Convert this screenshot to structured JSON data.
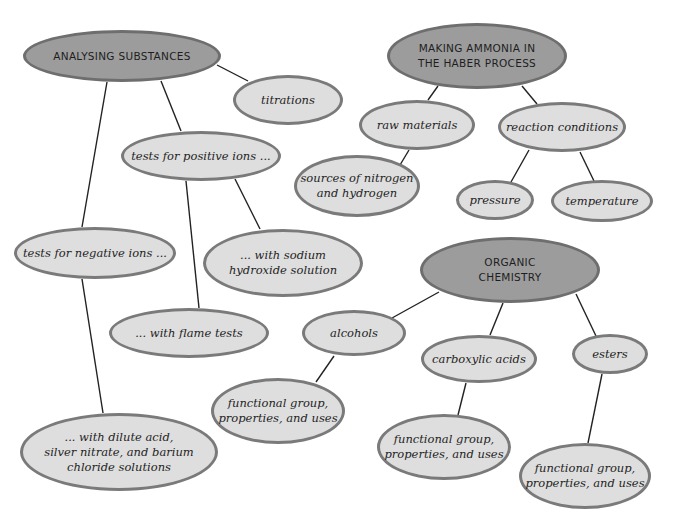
{
  "diagram": {
    "type": "concept-map",
    "colors": {
      "main_fill": "#9c9c9c",
      "main_border": "#6e6e6e",
      "sub_fill": "#dedede",
      "sub_border": "#7a7a7a",
      "line": "#222222"
    },
    "nodes": [
      {
        "id": "analysing",
        "label": "ANALYSING SUBSTANCES",
        "kind": "main",
        "cx": 122,
        "cy": 56,
        "rx": 99,
        "ry": 26
      },
      {
        "id": "titrations",
        "label": "titrations",
        "kind": "sub",
        "cx": 288,
        "cy": 100,
        "rx": 55,
        "ry": 25
      },
      {
        "id": "positive",
        "label": "tests for positive ions ...",
        "kind": "sub",
        "cx": 201,
        "cy": 156,
        "rx": 80,
        "ry": 25
      },
      {
        "id": "negative",
        "label": "tests for negative ions ...",
        "kind": "sub",
        "cx": 95,
        "cy": 253,
        "rx": 81,
        "ry": 26
      },
      {
        "id": "sodium",
        "label": "... with sodium\nhydroxide solution",
        "kind": "sub",
        "cx": 283,
        "cy": 263,
        "rx": 80,
        "ry": 34
      },
      {
        "id": "flame",
        "label": "... with flame tests",
        "kind": "sub",
        "cx": 189,
        "cy": 333,
        "rx": 80,
        "ry": 25
      },
      {
        "id": "dilute",
        "label": "... with dilute acid,\nsilver nitrate, and barium\nchloride solutions",
        "kind": "sub",
        "cx": 119,
        "cy": 452,
        "rx": 99,
        "ry": 39
      },
      {
        "id": "ammonia",
        "label": "MAKING AMMONIA IN\nTHE HABER PROCESS",
        "kind": "main",
        "cx": 477,
        "cy": 56,
        "rx": 90,
        "ry": 33
      },
      {
        "id": "raw",
        "label": "raw materials",
        "kind": "sub",
        "cx": 417,
        "cy": 125,
        "rx": 58,
        "ry": 25
      },
      {
        "id": "conditions",
        "label": "reaction conditions",
        "kind": "sub",
        "cx": 562,
        "cy": 127,
        "rx": 64,
        "ry": 25
      },
      {
        "id": "sources",
        "label": "sources of nitrogen\nand hydrogen",
        "kind": "sub",
        "cx": 357,
        "cy": 186,
        "rx": 63,
        "ry": 31
      },
      {
        "id": "pressure",
        "label": "pressure",
        "kind": "sub",
        "cx": 495,
        "cy": 200,
        "rx": 39,
        "ry": 20
      },
      {
        "id": "temperature",
        "label": "temperature",
        "kind": "sub",
        "cx": 602,
        "cy": 201,
        "rx": 51,
        "ry": 21
      },
      {
        "id": "organic",
        "label": "ORGANIC\nCHEMISTRY",
        "kind": "main",
        "cx": 510,
        "cy": 270,
        "rx": 90,
        "ry": 33
      },
      {
        "id": "alcohols",
        "label": "alcohols",
        "kind": "sub",
        "cx": 354,
        "cy": 333,
        "rx": 52,
        "ry": 23
      },
      {
        "id": "carboxylic",
        "label": "carboxylic acids",
        "kind": "sub",
        "cx": 479,
        "cy": 359,
        "rx": 58,
        "ry": 24
      },
      {
        "id": "esters",
        "label": "esters",
        "kind": "sub",
        "cx": 610,
        "cy": 354,
        "rx": 38,
        "ry": 20
      },
      {
        "id": "fg_alcohols",
        "label": "functional group,\nproperties, and uses",
        "kind": "sub",
        "cx": 278,
        "cy": 411,
        "rx": 67,
        "ry": 33
      },
      {
        "id": "fg_carboxylic",
        "label": "functional group,\nproperties, and uses",
        "kind": "sub",
        "cx": 444,
        "cy": 447,
        "rx": 67,
        "ry": 33
      },
      {
        "id": "fg_esters",
        "label": "functional group,\nproperties, and uses",
        "kind": "sub",
        "cx": 585,
        "cy": 476,
        "rx": 66,
        "ry": 33
      }
    ],
    "edges": [
      {
        "from": "analysing",
        "to": "titrations",
        "x1": 217,
        "y1": 65,
        "x2": 248,
        "y2": 81
      },
      {
        "from": "analysing",
        "to": "positive",
        "x1": 161,
        "y1": 81,
        "x2": 181,
        "y2": 131
      },
      {
        "from": "analysing",
        "to": "negative",
        "x1": 107,
        "y1": 82,
        "x2": 82,
        "y2": 227
      },
      {
        "from": "positive",
        "to": "flame",
        "x1": 186,
        "y1": 181,
        "x2": 199,
        "y2": 308
      },
      {
        "from": "positive",
        "to": "sodium",
        "x1": 235,
        "y1": 179,
        "x2": 260,
        "y2": 229
      },
      {
        "from": "negative",
        "to": "dilute",
        "x1": 82,
        "y1": 279,
        "x2": 103,
        "y2": 413
      },
      {
        "from": "ammonia",
        "to": "raw",
        "x1": 438,
        "y1": 86,
        "x2": 428,
        "y2": 100
      },
      {
        "from": "ammonia",
        "to": "conditions",
        "x1": 522,
        "y1": 86,
        "x2": 537,
        "y2": 104
      },
      {
        "from": "raw",
        "to": "sources",
        "x1": 409,
        "y1": 150,
        "x2": 400,
        "y2": 165
      },
      {
        "from": "conditions",
        "to": "pressure",
        "x1": 529,
        "y1": 150,
        "x2": 511,
        "y2": 182
      },
      {
        "from": "conditions",
        "to": "temperature",
        "x1": 580,
        "y1": 152,
        "x2": 594,
        "y2": 181
      },
      {
        "from": "organic",
        "to": "alcohols",
        "x1": 439,
        "y1": 292,
        "x2": 392,
        "y2": 318
      },
      {
        "from": "organic",
        "to": "carboxylic",
        "x1": 503,
        "y1": 303,
        "x2": 490,
        "y2": 335
      },
      {
        "from": "organic",
        "to": "esters",
        "x1": 576,
        "y1": 294,
        "x2": 596,
        "y2": 336
      },
      {
        "from": "alcohols",
        "to": "fg_alcohols",
        "x1": 334,
        "y1": 356,
        "x2": 316,
        "y2": 382
      },
      {
        "from": "carboxylic",
        "to": "fg_carboxylic",
        "x1": 466,
        "y1": 383,
        "x2": 458,
        "y2": 415
      },
      {
        "from": "esters",
        "to": "fg_esters",
        "x1": 602,
        "y1": 374,
        "x2": 588,
        "y2": 443
      }
    ]
  }
}
